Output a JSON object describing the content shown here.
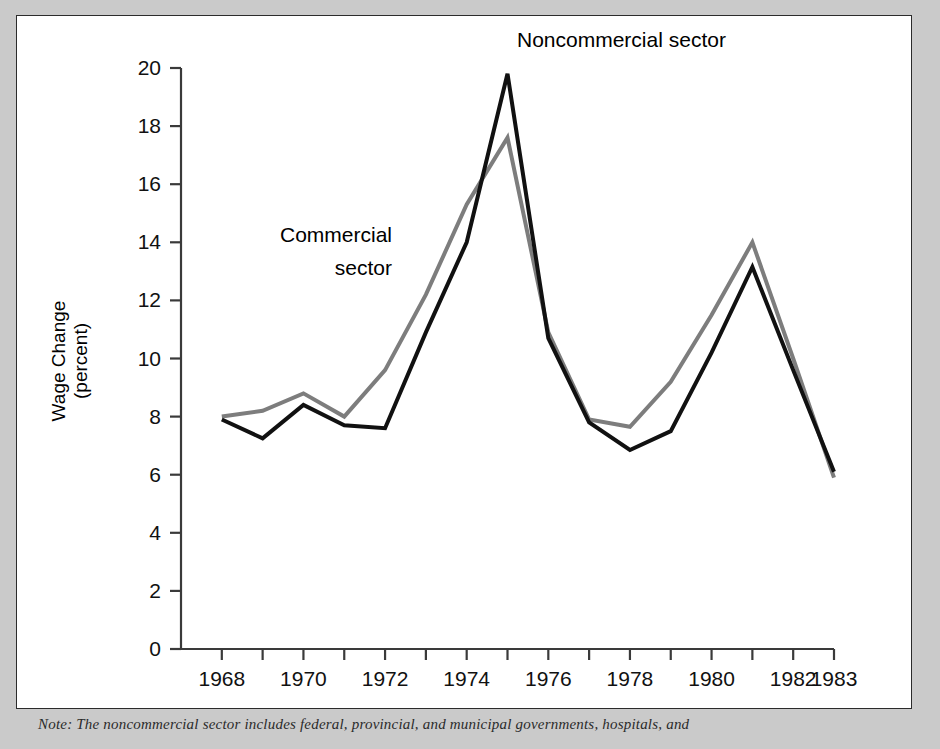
{
  "figure": {
    "background_color": "#cacaca",
    "panel_color": "#ffffff",
    "border_color": "#2b2b2b"
  },
  "note": {
    "text": "Note: The noncommercial sector includes federal, provincial, and municipal governments, hospitals, and"
  },
  "chart_data": {
    "type": "line",
    "title": "",
    "xlabel": "",
    "ylabel": "Wage Change (percent)",
    "ylabel_line1": "Wage Change",
    "ylabel_line2": "(percent)",
    "xlim": [
      1967,
      1983
    ],
    "ylim": [
      0,
      20
    ],
    "yticks": [
      0,
      2,
      4,
      6,
      8,
      10,
      12,
      14,
      16,
      18,
      20
    ],
    "ytick_labels": [
      "0",
      "2",
      "4",
      "6",
      "8",
      "10",
      "12",
      "14",
      "16",
      "18",
      "20"
    ],
    "xticks": [
      1968,
      1969,
      1970,
      1971,
      1972,
      1973,
      1974,
      1975,
      1976,
      1977,
      1978,
      1979,
      1980,
      1981,
      1982,
      1983
    ],
    "xtick_labels_shown": [
      "1968",
      "1970",
      "1972",
      "1974",
      "1976",
      "1978",
      "1980",
      "1982",
      "1983"
    ],
    "grid": false,
    "legend_position": "inline-annotations",
    "x": [
      1968,
      1969,
      1970,
      1971,
      1972,
      1973,
      1974,
      1975,
      1976,
      1977,
      1978,
      1979,
      1980,
      1981,
      1982,
      1983
    ],
    "series": [
      {
        "name": "Noncommercial sector",
        "color": "#111111",
        "line_width": 4,
        "values": [
          7.9,
          7.25,
          8.4,
          7.7,
          7.6,
          10.9,
          14.0,
          19.8,
          10.7,
          7.8,
          6.85,
          7.5,
          10.2,
          13.15,
          9.6,
          6.1
        ],
        "annotation": {
          "label": "Noncommercial sector",
          "lines": [
            "Noncommercial sector"
          ],
          "anchor_x": 1975,
          "anchor_y": 19.8
        }
      },
      {
        "name": "Commercial sector",
        "color": "#7d7d7d",
        "line_width": 4,
        "values": [
          8.0,
          8.2,
          8.8,
          8.0,
          9.6,
          12.2,
          15.3,
          17.6,
          10.9,
          7.9,
          7.65,
          9.2,
          11.5,
          14.0,
          10.0,
          5.9
        ],
        "annotation": {
          "label": "Commercial sector",
          "lines": [
            "Commercial",
            "sector"
          ],
          "anchor_x": 1972,
          "anchor_y": 12.6
        }
      }
    ]
  }
}
